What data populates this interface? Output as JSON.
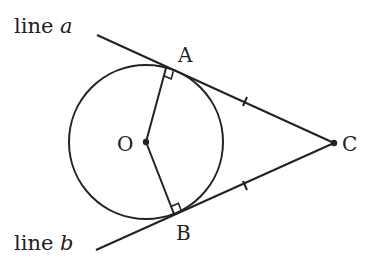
{
  "diagram": {
    "labels": {
      "line_a_prefix": "line ",
      "line_a_var": "a",
      "line_b_prefix": "line ",
      "line_b_var": "b",
      "A": "A",
      "B": "B",
      "C": "C",
      "O": "O"
    },
    "points": {
      "O": [
        146,
        142
      ],
      "A": [
        166,
        68
      ],
      "B": [
        174,
        214
      ],
      "C": [
        334,
        143
      ]
    },
    "circle": {
      "center": "O",
      "radius": 77
    },
    "segments": [
      "OA",
      "OB",
      "AC",
      "BC"
    ],
    "tangent_lines": [
      "line a",
      "line b"
    ],
    "right_angles": [
      "OAC",
      "OBC"
    ],
    "congruent_marks": [
      "AC",
      "BC"
    ],
    "stroke_color": "#222222"
  }
}
